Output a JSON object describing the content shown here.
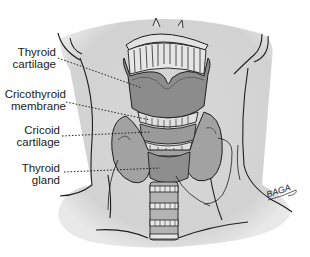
{
  "figure": {
    "labels": [
      {
        "id": "thyroid-cartilage",
        "line1": "Thyroid",
        "line2": "cartilage"
      },
      {
        "id": "cricothyroid-membrane",
        "line1": "Cricothyroid",
        "line2": "membrane"
      },
      {
        "id": "cricoid-cartilage",
        "line1": "Cricoid",
        "line2": "cartilage"
      },
      {
        "id": "thyroid-gland",
        "line1": "Thyroid",
        "line2": "gland"
      }
    ],
    "signature": "BAGA",
    "colors": {
      "skin": "#d6d6d6",
      "cartilage": "#8a8a8a",
      "gland": "#9c9c9c",
      "trachea": "#b4b4b4",
      "outline": "#1e1e1e"
    }
  }
}
